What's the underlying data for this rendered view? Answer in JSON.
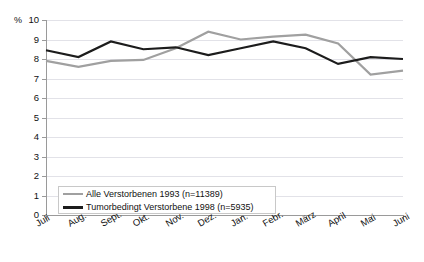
{
  "chart_data": {
    "type": "line",
    "title": "",
    "xlabel": "",
    "ylabel": "%",
    "ylim": [
      0,
      10
    ],
    "ytick_step": 1,
    "grid": true,
    "legend_position": "inside-bottom-left",
    "categories": [
      "Juli",
      "Aug.",
      "Sept.",
      "Okt.",
      "Nov.",
      "Dez.",
      "Jan.",
      "Febr.",
      "März",
      "April",
      "Mai",
      "Juni"
    ],
    "yticks": [
      "0",
      "1",
      "2",
      "3",
      "4",
      "5",
      "6",
      "7",
      "8",
      "9",
      "10"
    ],
    "series": [
      {
        "name": "Alle Verstorbenen 1993 (n=11389)",
        "color": "#a0a0a0",
        "values": [
          7.9,
          7.6,
          7.9,
          7.95,
          8.55,
          9.4,
          9.0,
          9.15,
          9.25,
          8.8,
          7.2,
          7.4
        ]
      },
      {
        "name": "Tumorbedingt Verstorbene 1998 (n=5935)",
        "color": "#1c1c1c",
        "values": [
          8.45,
          8.1,
          8.9,
          8.5,
          8.6,
          8.2,
          8.55,
          8.9,
          8.55,
          7.75,
          8.1,
          8.0
        ]
      }
    ]
  },
  "axis": {
    "unit_label": "%"
  },
  "legend": {
    "items": [
      {
        "label": "Alle Verstorbenen 1993 (n=11389)",
        "color": "#a0a0a0"
      },
      {
        "label": "Tumorbedingt Verstorbene 1998 (n=5935)",
        "color": "#1c1c1c"
      }
    ]
  }
}
